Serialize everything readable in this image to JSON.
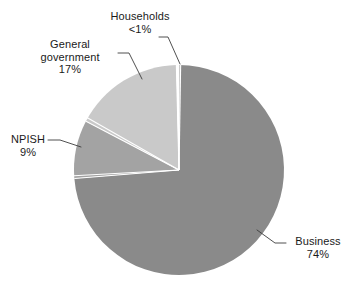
{
  "chart_data": {
    "type": "pie",
    "title": "",
    "subtitle": "",
    "legend_position": "none",
    "grid": false,
    "labels_on_chart": true,
    "categories": [
      "Business",
      "NPISH",
      "General government",
      "Households"
    ],
    "values": [
      74,
      9,
      17,
      0.4
    ],
    "value_labels": [
      "74%",
      "9%",
      "17%",
      "<1%"
    ],
    "colors": [
      "#8a8a8a",
      "#a3a3a3",
      "#c9c9c9",
      "#fdfdfd"
    ],
    "start_angle_deg": 0,
    "direction": "clockwise",
    "slices": [
      {
        "name": "Business",
        "label": "Business",
        "value": 74,
        "value_label": "74%",
        "color": "#8a8a8a",
        "start_deg": 0.9,
        "end_deg": 267.3
      },
      {
        "name": "NPISH",
        "label": "NPISH",
        "value": 9,
        "value_label": "9%",
        "color": "#a3a3a3",
        "start_deg": 267.3,
        "end_deg": 299.7
      },
      {
        "name": "General government",
        "label": "General government",
        "value": 17,
        "value_label": "17%",
        "color": "#c9c9c9",
        "start_deg": 299.7,
        "end_deg": 360.9
      },
      {
        "name": "Households",
        "label": "Households",
        "value": 0.4,
        "value_label": "<1%",
        "color": "#fdfdfd",
        "start_deg": 359.4,
        "end_deg": 360.9
      }
    ],
    "xlabel": "",
    "ylabel": ""
  },
  "labels": {
    "households": {
      "name": "Households",
      "percent": "<1%"
    },
    "general_government": {
      "name_line1": "General",
      "name_line2": "government",
      "percent": "17%"
    },
    "npish": {
      "name": "NPISH",
      "percent": "9%"
    },
    "business": {
      "name": "Business",
      "percent": "74%"
    }
  },
  "style": {
    "background": "#ffffff",
    "text_color": "#1a1a1a",
    "leader_line_color": "#3c3c3c",
    "slice_divider_color": "#ffffff"
  }
}
